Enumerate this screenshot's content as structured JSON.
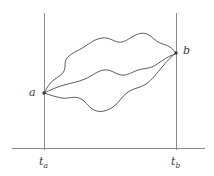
{
  "figure": {
    "background_color": "#ffffff",
    "axis_color": "#8a8a8a",
    "path_color": "#4a4a4a",
    "marker_color": "#3a3a3a"
  },
  "labels": {
    "point_a": "a",
    "point_b": "b",
    "tick_a_base": "t",
    "tick_a_sub": "a",
    "tick_b_base": "t",
    "tick_b_sub": "b"
  },
  "chart_data": {
    "type": "line",
    "xlabel": "",
    "ylabel": "",
    "grid": false,
    "legend": "none",
    "axes": {
      "horizontal_axis": {
        "x_start": 12,
        "x_end": 205,
        "y": 148
      },
      "vertical_line_a": {
        "x": 44,
        "y_top": 13,
        "y_bottom": 150
      },
      "vertical_line_b": {
        "x": 176,
        "y_top": 13,
        "y_bottom": 150
      }
    },
    "endpoints": {
      "a": {
        "x": 44,
        "y": 93,
        "label": "a"
      },
      "b": {
        "x": 176,
        "y": 53,
        "label": "b"
      }
    },
    "ticks": [
      {
        "x": 44,
        "label": "t_a"
      },
      {
        "x": 176,
        "label": "t_b"
      }
    ],
    "series": [
      {
        "name": "upper-path",
        "path": "M 44 93 C 47 88, 50 82, 55 79 C 59 76, 62 75, 64 71 C 66 66, 64 62, 67 58 C 71 53, 78 51, 84 47 C 90 43, 95 39, 102 38 C 109 37, 113 41, 118 42 C 123 43, 127 40, 132 37 C 137 34, 142 32, 147 34 C 152 36, 155 41, 160 43 C 165 45, 170 45, 176 53"
      },
      {
        "name": "middle-path",
        "path": "M 44 93 C 50 90, 57 87, 64 85 C 71 83, 78 82, 85 79 C 92 76, 97 71, 104 70 C 111 69, 115 74, 121 75 C 127 76, 132 72, 138 70 C 144 68, 149 69, 154 66 C 159 63, 164 59, 170 56 C 173 55, 175 54, 176 53"
      },
      {
        "name": "lower-path",
        "path": "M 44 93 C 50 95, 56 97, 62 98 C 68 99, 73 96, 79 98 C 85 100, 88 107, 94 110 C 100 113, 107 111, 113 107 C 119 103, 122 96, 128 92 C 134 88, 140 88, 146 84 C 152 80, 157 73, 163 66 C 168 60, 173 55, 176 53"
      }
    ]
  }
}
